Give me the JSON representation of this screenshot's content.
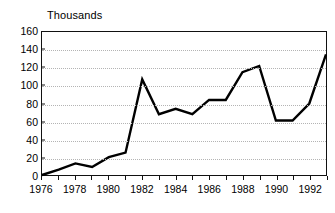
{
  "chart_data": {
    "type": "line",
    "title": "",
    "subtitle": "",
    "unit_label": "Thousands",
    "xlabel": "",
    "ylabel": "",
    "xlim": [
      1976,
      1993
    ],
    "ylim": [
      0,
      160
    ],
    "y_ticks": [
      0,
      20,
      40,
      60,
      80,
      100,
      120,
      140,
      160
    ],
    "x_ticks": [
      1976,
      1977,
      1978,
      1979,
      1980,
      1981,
      1982,
      1983,
      1984,
      1985,
      1986,
      1987,
      1988,
      1989,
      1990,
      1991,
      1992,
      1993
    ],
    "x_tick_labels": [
      "1976",
      "",
      "1978",
      "",
      "1980",
      "",
      "1982",
      "",
      "1984",
      "",
      "1986",
      "",
      "1988",
      "",
      "1990",
      "",
      "1992",
      ""
    ],
    "grid": true,
    "grid_axis": "y",
    "grid_style": "dotted",
    "legend": false,
    "legend_position": "none",
    "line_color": "#000000",
    "grid_color": "#b4b4b4",
    "axis_color": "#111111",
    "background_color": "#ffffff",
    "x": [
      1976,
      1977,
      1978,
      1979,
      1980,
      1981,
      1982,
      1983,
      1984,
      1985,
      1986,
      1987,
      1988,
      1989,
      1990,
      1991,
      1992,
      1993
    ],
    "values": [
      0,
      6,
      13,
      9,
      20,
      25,
      107,
      68,
      74,
      68,
      84,
      84,
      115,
      122,
      61,
      61,
      80,
      135
    ]
  }
}
